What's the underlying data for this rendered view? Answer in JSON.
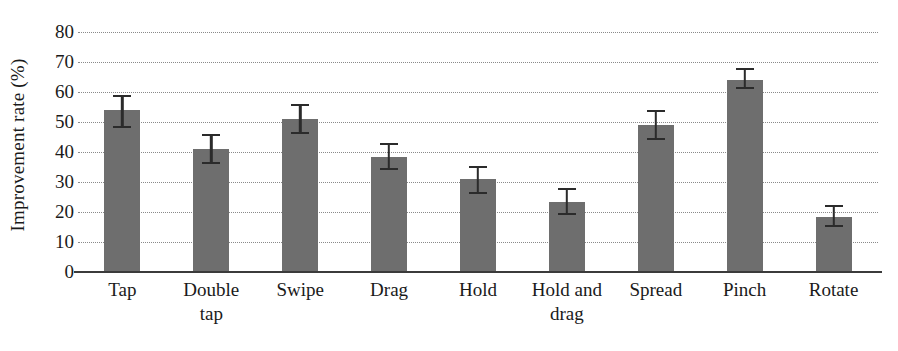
{
  "chart_data": {
    "type": "bar",
    "title": "",
    "xlabel": "",
    "ylabel": "Improvement rate (%)",
    "ylim": [
      0,
      80
    ],
    "ytick_step": 10,
    "yticks": [
      80,
      70,
      60,
      50,
      40,
      30,
      20,
      10,
      0
    ],
    "grid": true,
    "grid_style": "dotted",
    "legend": false,
    "bar_color": "#6e6e6e",
    "errorbar_color": "#2b2b2b",
    "axis_color": "#3b3b3b",
    "categories": [
      "Tap",
      "Double tap",
      "Swipe",
      "Drag",
      "Hold",
      "Hold and drag",
      "Spread",
      "Pinch",
      "Rotate"
    ],
    "category_lines": [
      [
        "Tap",
        ""
      ],
      [
        "Double",
        "tap"
      ],
      [
        "Swipe",
        ""
      ],
      [
        "Drag",
        ""
      ],
      [
        "Hold",
        ""
      ],
      [
        "Hold and",
        "drag"
      ],
      [
        "Spread",
        ""
      ],
      [
        "Pinch",
        ""
      ],
      [
        "Rotate",
        ""
      ]
    ],
    "values": [
      54,
      41,
      51,
      38.5,
      31,
      23.5,
      49,
      64,
      18.5
    ],
    "error_low": [
      48,
      36,
      46,
      34,
      26,
      19,
      44,
      61,
      15
    ],
    "error_high": [
      59,
      46,
      56,
      43,
      35.5,
      28,
      54,
      68,
      22.5
    ],
    "series": [
      {
        "name": "Improvement rate",
        "values": [
          54,
          41,
          51,
          38.5,
          31,
          23.5,
          49,
          64,
          18.5
        ]
      }
    ]
  }
}
